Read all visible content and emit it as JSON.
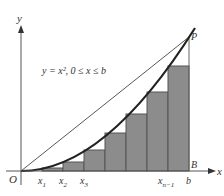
{
  "figure": {
    "equation_label": "y = x², 0 ≤ x ≤ b",
    "axes": {
      "x_label": "x",
      "y_label": "y",
      "origin_label": "O"
    },
    "points": {
      "P": "P",
      "B": "B"
    },
    "tick_labels": [
      {
        "main": "x",
        "sub": "1"
      },
      {
        "main": "x",
        "sub": "2"
      },
      {
        "main": "x",
        "sub": "3"
      },
      {
        "main": "x",
        "sub": "n−1"
      },
      {
        "main": "b",
        "sub": ""
      }
    ],
    "colors": {
      "rect_fill": "#8c8c8c",
      "rect_stroke": "#555555",
      "curve": "#222222",
      "chord": "#444444",
      "axis": "#555555",
      "background": "#ffffff"
    },
    "rectangles": [
      {
        "x0": 42,
        "x1": 63,
        "top": 168
      },
      {
        "x0": 63,
        "x1": 84,
        "top": 162
      },
      {
        "x0": 84,
        "x1": 105,
        "top": 150
      },
      {
        "x0": 105,
        "x1": 126,
        "top": 133
      },
      {
        "x0": 126,
        "x1": 147,
        "top": 114
      },
      {
        "x0": 147,
        "x1": 168,
        "top": 92
      },
      {
        "x0": 168,
        "x1": 189,
        "top": 66
      }
    ]
  }
}
